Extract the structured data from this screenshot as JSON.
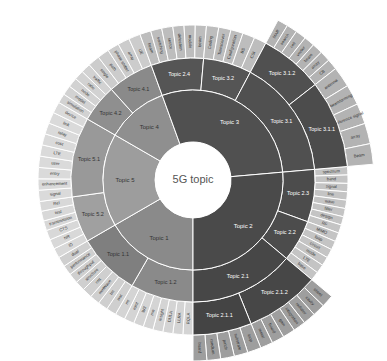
{
  "chart_data": {
    "type": "sunburst",
    "title": "5G topic",
    "center": {
      "x": 193,
      "y": 180
    },
    "radii": {
      "hole": 38,
      "r1": 90,
      "r2": 122,
      "r3": 155,
      "r3_ext": 181
    },
    "colors": {
      "dark": "#4f4f4f",
      "mid_dark": "#5c5c5c",
      "mid": "#8a8a8a",
      "mid_light": "#9d9d9d",
      "leaf_dark": "#a6a6a6",
      "leaf_mid": "#bdbdbd",
      "leaf_light": "#d6d6d6",
      "stroke": "#ffffff"
    },
    "level1": [
      {
        "label": "Topic 1",
        "start": 90,
        "end": 150,
        "color": "#8a8a8a",
        "text": "dark"
      },
      {
        "label": "Topic 5",
        "start": 150,
        "end": 210,
        "color": "#9d9d9d",
        "text": "dark"
      },
      {
        "label": "Topic 4",
        "start": 210,
        "end": 250,
        "color": "#8f8f8f",
        "text": "dark"
      },
      {
        "label": "Topic 3",
        "start": 250,
        "end": 355,
        "color": "#505050",
        "text": "light"
      },
      {
        "label": "Topic 2",
        "start": 355,
        "end": 450,
        "color": "#4a4a4a",
        "text": "light"
      }
    ],
    "level2": [
      {
        "label": "Topic 1.2",
        "start": 90,
        "end": 120,
        "color": "#8a8a8a",
        "text": "dark"
      },
      {
        "label": "Topic 1.1",
        "start": 120,
        "end": 150,
        "color": "#7f7f7f",
        "text": "dark"
      },
      {
        "label": "Topic 5.2",
        "start": 150,
        "end": 172,
        "color": "#a0a0a0",
        "text": "dark"
      },
      {
        "label": "Topic 5.1",
        "start": 172,
        "end": 210,
        "color": "#999999",
        "text": "dark"
      },
      {
        "label": "Topic 4.2",
        "start": 210,
        "end": 228,
        "color": "#8f8f8f",
        "text": "dark"
      },
      {
        "label": "Topic 4.1",
        "start": 228,
        "end": 250,
        "color": "#8a8a8a",
        "text": "dark"
      },
      {
        "label": "Topic 2.4",
        "start": 250,
        "end": 275,
        "color": "#555555",
        "text": "light"
      },
      {
        "label": "Topic 3.2",
        "start": 275,
        "end": 298,
        "color": "#555555",
        "text": "light"
      },
      {
        "label": "Topic 3.1",
        "start": 298,
        "end": 355,
        "color": "#505050",
        "text": "light"
      },
      {
        "label": "Topic 2.3",
        "start": 355,
        "end": 380,
        "color": "#4c4c4c",
        "text": "light"
      },
      {
        "label": "Topic 2.2",
        "start": 380,
        "end": 400,
        "color": "#4c4c4c",
        "text": "light"
      },
      {
        "label": "Topic 2.1",
        "start": 400,
        "end": 450,
        "color": "#474747",
        "text": "light"
      }
    ],
    "level3": [
      {
        "label": "Topic 3.1.2",
        "start": 298,
        "end": 322,
        "color": "#505050",
        "text": "light"
      },
      {
        "label": "Topic 3.1.1",
        "start": 322,
        "end": 355,
        "color": "#4c4c4c",
        "text": "light"
      },
      {
        "label": "Topic 2.1.2",
        "start": 400,
        "end": 428,
        "color": "#474747",
        "text": "light"
      },
      {
        "label": "Topic 2.1.1",
        "start": 428,
        "end": 450,
        "color": "#444444",
        "text": "light"
      }
    ],
    "leaves": [
      {
        "parent": "Topic 1.2",
        "start": 90,
        "end": 120,
        "ring": "r3",
        "color": "#d4d4d4",
        "items": [
          "RQLA",
          "LLRA",
          "DULA",
          "insight",
          "mn",
          "W3",
          "mmt",
          "mt"
        ]
      },
      {
        "parent": "Topic 1.1",
        "start": 120,
        "end": 150,
        "ring": "r3",
        "color": "#cfcfcf",
        "items": [
          "wot",
          "tm",
          "mmWave",
          "rmt",
          "structure",
          "throughput",
          "performance",
          "dual"
        ]
      },
      {
        "parent": "Topic 5.2",
        "start": 150,
        "end": 172,
        "ring": "r3",
        "color": "#d8d8d8",
        "items": [
          "ID",
          "NR",
          "CTS",
          "transmission",
          "test",
          "Rel"
        ]
      },
      {
        "parent": "Topic 5.1",
        "start": 172,
        "end": 210,
        "ring": "r3",
        "color": "#dadada",
        "items": [
          "signal",
          "enhancement",
          "entry",
          "user",
          "LTE",
          "cost",
          "relay",
          "link",
          "device"
        ]
      },
      {
        "parent": "Topic 4.2",
        "start": 210,
        "end": 228,
        "ring": "r3",
        "color": "#d2d2d2",
        "items": [
          "simulation",
          "model",
          "node",
          "ratio",
          "traffic"
        ]
      },
      {
        "parent": "Topic 4.1",
        "start": 228,
        "end": 250,
        "ring": "r3",
        "color": "#cccccc",
        "items": [
          "single",
          "path",
          "phase shifter",
          "array",
          "UE"
        ]
      },
      {
        "parent": "Topic 2.4",
        "start": 250,
        "end": 275,
        "ring": "r3",
        "color": "#bdbdbd",
        "items": [
          "beam",
          "switching",
          "sector",
          "detection",
          "module",
          "beam"
        ]
      },
      {
        "parent": "Topic 3.2",
        "start": 275,
        "end": 298,
        "ring": "r3",
        "color": "#bdbdbd",
        "items": [
          "Coding",
          "Transceiver",
          "Configuration",
          "BS",
          "CSI"
        ]
      },
      {
        "parent": "Topic 3.1.2",
        "start": 298,
        "end": 322,
        "ring": "r3_ext",
        "color": "#b3b3b3",
        "items": [
          "MAR",
          "search",
          "cell",
          "vector",
          "beam",
          "array",
          "CB"
        ]
      },
      {
        "parent": "Topic 3.1.1",
        "start": 322,
        "end": 355,
        "ring": "r3_ext",
        "color": "#b3b3b3",
        "items": [
          "antenna",
          "beamforming",
          "reference signal",
          "array",
          "Beam"
        ]
      },
      {
        "parent": "Topic 2.3",
        "start": 355,
        "end": 380,
        "ring": "r3",
        "color": "#c4c4c4",
        "items": [
          "spectrum",
          "band",
          "signal",
          "line",
          "wave",
          "filter",
          "design",
          "RF"
        ]
      },
      {
        "parent": "Topic 2.2",
        "start": 380,
        "end": 400,
        "ring": "r3",
        "color": "#c4c4c4",
        "items": [
          "MIMO",
          "loop",
          "circuit",
          "mode",
          "LTE",
          "base"
        ]
      },
      {
        "parent": "Topic 2.1.2",
        "start": 400,
        "end": 428,
        "ring": "r3_ext",
        "color": "#9e9e9e",
        "items": [
          "sheet",
          "cavity",
          "radiator",
          "integration",
          "gain",
          "board",
          "metal"
        ]
      },
      {
        "parent": "Topic 2.1.1",
        "start": 428,
        "end": 450,
        "ring": "r3_ext",
        "color": "#9e9e9e",
        "items": [
          "loop",
          "substrate",
          "patch",
          "medium",
          "board"
        ]
      }
    ]
  }
}
